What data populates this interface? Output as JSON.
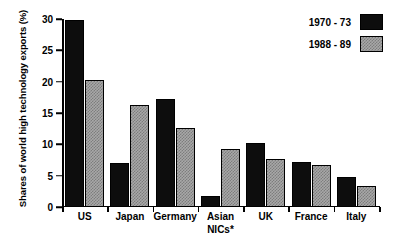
{
  "chart_data": {
    "type": "bar",
    "title": "",
    "subtitle": "",
    "xlabel": "",
    "ylabel": "Shares of world high technology exports (%)",
    "categories": [
      "US",
      "Japan",
      "Germany",
      "Asian\nNICs*",
      "UK",
      "France",
      "Italy"
    ],
    "series": [
      {
        "name": "1970 - 73",
        "color": "#0d0d0d",
        "values": [
          29.9,
          7.1,
          17.2,
          1.7,
          10.2,
          7.2,
          4.8
        ]
      },
      {
        "name": "1988 - 89",
        "color": "#a8a8a8",
        "values": [
          20.3,
          16.2,
          12.6,
          9.3,
          7.6,
          6.7,
          3.4
        ]
      }
    ],
    "ylim": [
      0,
      30
    ],
    "yticks": [
      0,
      5,
      10,
      15,
      20,
      25,
      30
    ],
    "ytick_labels": [
      "0",
      "5",
      "10",
      "15",
      "20",
      "25",
      "30"
    ],
    "grid": false,
    "legend_position": "top-right"
  },
  "legend": {
    "entries": [
      {
        "label": "1970 - 73"
      },
      {
        "label": "1988 - 89"
      }
    ]
  },
  "axes": {
    "y_title": "Shares of world high technology exports (%)"
  }
}
